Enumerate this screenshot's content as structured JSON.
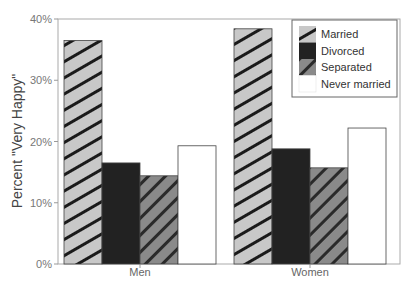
{
  "chart_data": {
    "type": "bar",
    "title": "",
    "xlabel": "",
    "ylabel": "Percent \"Very Happy\"",
    "ylim": [
      0,
      40
    ],
    "yticks": [
      "0%",
      "10%",
      "20%",
      "30%",
      "40%"
    ],
    "grid": false,
    "legend_position": "upper right (inside)",
    "categories": [
      "Men",
      "Women"
    ],
    "series": [
      {
        "name": "Married",
        "values": [
          36.5,
          38.4
        ],
        "pattern": "light-gray-diagonal-hatch",
        "color": "#c8c8c8"
      },
      {
        "name": "Divorced",
        "values": [
          16.5,
          18.8
        ],
        "pattern": "solid-dark",
        "color": "#222222"
      },
      {
        "name": "Separated",
        "values": [
          14.4,
          15.7
        ],
        "pattern": "gray-back-diagonal-hatch",
        "color": "#808080"
      },
      {
        "name": "Never married",
        "values": [
          19.3,
          22.2
        ],
        "pattern": "white",
        "color": "#ffffff"
      }
    ]
  }
}
